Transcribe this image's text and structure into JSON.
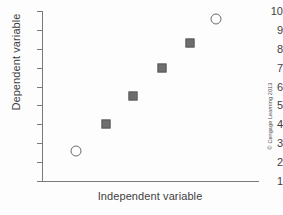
{
  "chart_data": {
    "type": "scatter",
    "title": "",
    "xlabel": "Independent variable",
    "ylabel": "Dependent variable",
    "xlim": [
      0,
      1
    ],
    "ylim": [
      1,
      10
    ],
    "grid": false,
    "legend": null,
    "y_ticks": [
      10,
      9,
      8,
      7,
      6,
      5,
      4,
      3,
      2,
      1
    ],
    "y_tick_labels": [
      "10",
      "9",
      "8",
      "7",
      "6",
      "5",
      "4",
      "3",
      "2",
      "1"
    ],
    "x_ticks": [],
    "x_tick_labels": [],
    "series": [
      {
        "name": "outliers",
        "marker": "open-circle",
        "color": "#6b6b6b",
        "points": [
          {
            "x": 0.155,
            "y": 2.6
          },
          {
            "x": 0.8,
            "y": 9.6
          }
        ]
      },
      {
        "name": "data",
        "marker": "filled-square",
        "color": "#6e6e6e",
        "points": [
          {
            "x": 0.295,
            "y": 4.0
          },
          {
            "x": 0.42,
            "y": 5.5
          },
          {
            "x": 0.555,
            "y": 7.0
          },
          {
            "x": 0.68,
            "y": 8.3
          }
        ]
      }
    ]
  },
  "credit": {
    "text": "© Cengage Learning 2013"
  }
}
